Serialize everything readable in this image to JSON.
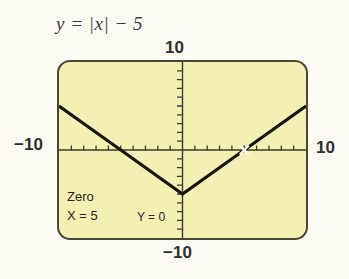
{
  "figure": {
    "equation": "y = |x| − 5",
    "equation_parts": {
      "lhs": "y",
      "equals": "=",
      "abs_open": "|",
      "variable": "x",
      "abs_close": "|",
      "minus": "−",
      "constant": "5"
    }
  },
  "axis_labels": {
    "top": "10",
    "left": "−10",
    "right": "10",
    "bottom": "−10"
  },
  "readout": {
    "operation": "Zero",
    "x_value": "X = 5",
    "y_value": "Y = 0"
  },
  "colors": {
    "screen_background": "#f4f0b4",
    "screen_border": "#4a4736",
    "curve": "#16150e",
    "axis": "#3a3a2c",
    "page_background": "#fcfbf4",
    "text": "#2f2f2f",
    "cursor": "#ffffff"
  },
  "chart_data": {
    "type": "line",
    "title": "y = |x| − 5",
    "xlabel": "",
    "ylabel": "",
    "xlim": [
      -10,
      10
    ],
    "ylim": [
      -10,
      10
    ],
    "xticks": [
      -9,
      -8,
      -7,
      -6,
      -5,
      -4,
      -3,
      -2,
      -1,
      1,
      2,
      3,
      4,
      5,
      6,
      7,
      8,
      9
    ],
    "yticks": [
      -9,
      -8,
      -7,
      -6,
      -5,
      -4,
      -3,
      -2,
      -1,
      1,
      2,
      3,
      4,
      5,
      6,
      7,
      8,
      9
    ],
    "grid": false,
    "legend": null,
    "series": [
      {
        "name": "y = |x| - 5",
        "x": [
          -10,
          -5,
          0,
          5,
          10
        ],
        "y": [
          5,
          0,
          -5,
          0,
          5
        ]
      }
    ],
    "annotations": [
      {
        "label": "Zero",
        "x": 5,
        "y": 0,
        "marker": "cursor-crosshair",
        "text_lines": [
          "Zero",
          "X = 5",
          "Y = 0"
        ]
      }
    ],
    "axis_edge_labels": {
      "top": "10",
      "bottom": "-10",
      "left": "-10",
      "right": "10"
    }
  }
}
